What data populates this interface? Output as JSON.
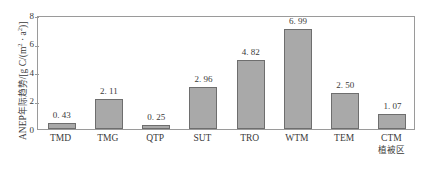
{
  "chart_data": {
    "type": "bar",
    "title": "",
    "xlabel": "植被区",
    "ylabel": "ANEP年际趋势/[g C/(m² · a²)]",
    "ylabel_prefix": "ANEP",
    "ylabel_cjk": "年际趋势",
    "ylabel_units": "/[g C/(m",
    "ylabel_sup1": "2",
    "ylabel_mid": " · a",
    "ylabel_sup2": "2",
    "ylabel_tail": ")]",
    "categories": [
      "TMD",
      "TMG",
      "QTP",
      "SUT",
      "TRO",
      "WTM",
      "TEM",
      "CTM"
    ],
    "values": [
      0.43,
      2.11,
      0.25,
      2.96,
      4.82,
      6.99,
      2.5,
      1.07
    ],
    "value_labels": [
      "0. 43",
      "2. 11",
      "0. 25",
      "2. 96",
      "4. 82",
      "6. 99",
      "2. 50",
      "1. 07"
    ],
    "ylim": [
      0,
      8
    ],
    "yticks": [
      0,
      2,
      4,
      6,
      8
    ],
    "ytick_labels": [
      "0",
      "2",
      "4",
      "6",
      "8"
    ],
    "grid": false,
    "legend": null,
    "axis_note": "植被区",
    "colors": {
      "bar_fill": "#a9a9a9",
      "bar_stroke": "#6e6e6e",
      "axis": "#9a9a9a",
      "text": "#3a3a3a",
      "background": "#ffffff"
    }
  }
}
